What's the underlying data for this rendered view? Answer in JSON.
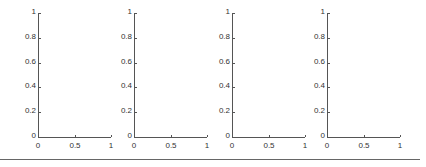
{
  "chart_data": [
    {
      "type": "line",
      "title": "",
      "xlabel": "",
      "ylabel": "",
      "xlim": [
        0,
        1
      ],
      "ylim": [
        0,
        1
      ],
      "xticks": [
        "0",
        "0.5",
        "1"
      ],
      "yticks": [
        "0",
        "0.2",
        "0.4",
        "0.6",
        "0.8",
        "1"
      ],
      "series": [],
      "grid": false
    },
    {
      "type": "line",
      "title": "",
      "xlabel": "",
      "ylabel": "",
      "xlim": [
        0,
        1
      ],
      "ylim": [
        0,
        1
      ],
      "xticks": [
        "0",
        "0.5",
        "1"
      ],
      "yticks": [
        "0",
        "0.2",
        "0.4",
        "0.6",
        "0.8",
        "1"
      ],
      "series": [],
      "grid": false
    },
    {
      "type": "line",
      "title": "",
      "xlabel": "",
      "ylabel": "",
      "xlim": [
        0,
        1
      ],
      "ylim": [
        0,
        1
      ],
      "xticks": [
        "0",
        "0.5",
        "1"
      ],
      "yticks": [
        "0",
        "0.2",
        "0.4",
        "0.6",
        "0.8",
        "1"
      ],
      "series": [],
      "grid": false
    },
    {
      "type": "line",
      "title": "",
      "xlabel": "",
      "ylabel": "",
      "xlim": [
        0,
        1
      ],
      "ylim": [
        0,
        1
      ],
      "xticks": [
        "0",
        "0.5",
        "1"
      ],
      "yticks": [
        "0",
        "0.2",
        "0.4",
        "0.6",
        "0.8",
        "1"
      ],
      "series": [],
      "grid": false
    }
  ],
  "ticks": {
    "x": [
      "0",
      "0.5",
      "1"
    ],
    "y": [
      "0",
      "0.2",
      "0.4",
      "0.6",
      "0.8",
      "1"
    ]
  }
}
